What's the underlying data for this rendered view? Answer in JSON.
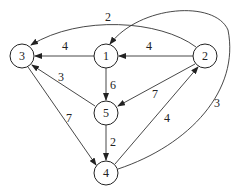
{
  "diagram": {
    "type": "directed-weighted-graph",
    "nodes": [
      {
        "id": "1",
        "label": "1",
        "x": 106,
        "y": 56
      },
      {
        "id": "2",
        "label": "2",
        "x": 205,
        "y": 56
      },
      {
        "id": "3",
        "label": "3",
        "x": 22,
        "y": 56
      },
      {
        "id": "4",
        "label": "4",
        "x": 106,
        "y": 173
      },
      {
        "id": "5",
        "label": "5",
        "x": 106,
        "y": 113
      }
    ],
    "edges": [
      {
        "from": "1",
        "to": "3",
        "weight": "4"
      },
      {
        "from": "2",
        "to": "1",
        "weight": "4"
      },
      {
        "from": "2",
        "to": "3",
        "weight": "2"
      },
      {
        "from": "1",
        "to": "5",
        "weight": "6"
      },
      {
        "from": "5",
        "to": "3",
        "weight": "3"
      },
      {
        "from": "2",
        "to": "5",
        "weight": "7"
      },
      {
        "from": "3",
        "to": "4",
        "weight": "7"
      },
      {
        "from": "5",
        "to": "4",
        "weight": "2"
      },
      {
        "from": "4",
        "to": "2",
        "weight": "4"
      },
      {
        "from": "4",
        "to": "1",
        "weight": "3"
      }
    ]
  }
}
